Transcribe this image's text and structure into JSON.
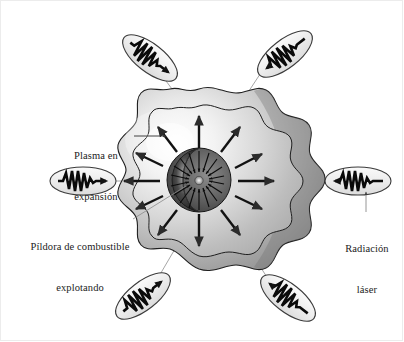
{
  "figure": {
    "title_visible": false,
    "language": "es",
    "background_color": "#ffffff",
    "border_color": "#ececec"
  },
  "labels": {
    "plasma": {
      "line1": "Plasma en",
      "line2": "expansión",
      "leader": "horizontal-arrow-right"
    },
    "pellet": {
      "line1": "Píldora de combustible",
      "line2": "explotando",
      "leader": "diagonal-line-up-right"
    },
    "laser": {
      "line1": "Radiación",
      "line2": "láser",
      "leader": "vertical-arrow-up"
    }
  },
  "colors": {
    "cloud_outer_light": "#f2f2f2",
    "cloud_outer_dark": "#9a9a9a",
    "cloud_inner_light": "#fbfbfb",
    "cloud_inner_mid": "#c9c9c9",
    "core_dark": "#2b2b2b",
    "core_mid": "#6e6e6e",
    "stroke": "#1a1a1a",
    "leader_line": "#8a8a8a",
    "text": "#1b1b1b",
    "capsule_fill": "#ededed"
  },
  "core": {
    "name": "fuel-pellet",
    "inward_arrow_count": 18,
    "center_x": 199,
    "center_y": 180,
    "radius": 32
  },
  "plasma": {
    "name": "expanding-plasma-shell",
    "outward_arrow_count": 12
  },
  "laser_beams": [
    {
      "id": "beam-left",
      "position": "left",
      "angle_deg": 0,
      "wave_direction": "right",
      "tilt_deg": 0
    },
    {
      "id": "beam-right",
      "position": "right",
      "angle_deg": 180,
      "wave_direction": "left",
      "tilt_deg": 0
    },
    {
      "id": "beam-top-left",
      "position": "top-left",
      "angle_deg": 135,
      "wave_direction": "down-right",
      "tilt_deg": 38
    },
    {
      "id": "beam-top-right",
      "position": "top-right",
      "angle_deg": 45,
      "wave_direction": "down-left",
      "tilt_deg": -38
    },
    {
      "id": "beam-bottom-left",
      "position": "bottom-left",
      "angle_deg": 225,
      "wave_direction": "up-right",
      "tilt_deg": -38
    },
    {
      "id": "beam-bottom-right",
      "position": "bottom-right",
      "angle_deg": 315,
      "wave_direction": "up-left",
      "tilt_deg": 38
    }
  ]
}
